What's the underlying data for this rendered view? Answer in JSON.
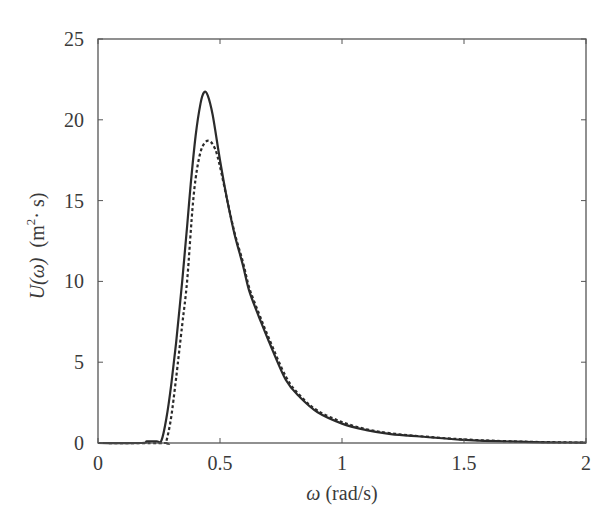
{
  "chart_data": {
    "type": "line",
    "title": "",
    "xlabel": "ω (rad/s)",
    "ylabel": "U(ω)  (m²· s)",
    "xlabel_parts": {
      "symbol": "ω",
      "unit": " (rad/s)"
    },
    "ylabel_parts": {
      "symbol": "U(ω)",
      "unit": "(m",
      "sup": "2",
      "unit_end": "· s)"
    },
    "xlim": [
      0,
      2
    ],
    "ylim": [
      0,
      25
    ],
    "xticks": [
      0,
      0.5,
      1,
      1.5,
      2
    ],
    "xtick_labels": [
      "0",
      "0.5",
      "1",
      "1.5",
      "2"
    ],
    "yticks": [
      0,
      5,
      10,
      15,
      20,
      25
    ],
    "ytick_labels": [
      "0",
      "5",
      "10",
      "15",
      "20",
      "25"
    ],
    "grid": false,
    "legend": null,
    "series": [
      {
        "name": "solid",
        "style": "solid",
        "color": "#2b2b2b",
        "x": [
          0,
          0.18,
          0.2,
          0.24,
          0.26,
          0.28,
          0.3,
          0.32,
          0.345,
          0.365,
          0.38,
          0.4,
          0.42,
          0.435,
          0.45,
          0.47,
          0.5,
          0.53,
          0.56,
          0.594,
          0.62,
          0.66,
          0.7,
          0.77,
          0.83,
          0.9,
          1.0,
          1.1,
          1.2,
          1.32,
          1.5,
          1.75,
          2.0
        ],
        "values": [
          0,
          0,
          0.1,
          0.1,
          0.15,
          1.5,
          3.6,
          6.2,
          10.0,
          13.4,
          16.0,
          19.0,
          21.0,
          21.7,
          21.5,
          20.3,
          17.5,
          15.0,
          12.9,
          11.0,
          9.4,
          7.8,
          6.3,
          3.9,
          2.8,
          1.9,
          1.2,
          0.8,
          0.55,
          0.4,
          0.2,
          0.07,
          0.02
        ]
      },
      {
        "name": "dashed",
        "style": "dashed",
        "color": "#2b2b2b",
        "x": [
          0,
          0.27,
          0.28,
          0.3,
          0.32,
          0.345,
          0.365,
          0.39,
          0.41,
          0.43,
          0.455,
          0.48,
          0.5,
          0.53,
          0.56,
          0.594,
          0.62,
          0.66,
          0.7,
          0.77,
          0.83,
          0.9,
          1.0,
          1.1,
          1.2,
          1.32,
          1.5,
          1.75,
          2.0
        ],
        "values": [
          0,
          0,
          0.1,
          1.6,
          4.0,
          7.3,
          10.0,
          15.0,
          17.3,
          18.4,
          18.7,
          18.2,
          17.1,
          15.0,
          13.0,
          11.2,
          9.6,
          8.0,
          6.5,
          4.1,
          2.9,
          2.0,
          1.3,
          0.85,
          0.6,
          0.42,
          0.22,
          0.08,
          0.02
        ]
      }
    ]
  }
}
